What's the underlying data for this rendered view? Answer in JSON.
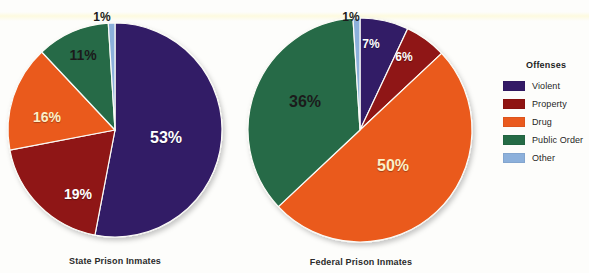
{
  "figure": {
    "background": "#fdfdfb",
    "width": 589,
    "height": 273
  },
  "legend": {
    "title": "Offenses",
    "position": "right",
    "items": [
      {
        "label": "Violent",
        "color": "#331a66"
      },
      {
        "label": "Property",
        "color": "#8f1412"
      },
      {
        "label": "Drug",
        "color": "#ea5a1e"
      },
      {
        "label": "Public Order",
        "color": "#256b46"
      },
      {
        "label": "Other",
        "color": "#8cb0db"
      }
    ]
  },
  "chart_data": [
    {
      "type": "pie",
      "title": "State Prison Inmates",
      "categories": [
        "Violent",
        "Property",
        "Drug",
        "Public Order",
        "Other"
      ],
      "values": [
        53,
        19,
        16,
        11,
        1
      ],
      "labels": [
        "53%",
        "19%",
        "16%",
        "11%",
        "1%"
      ],
      "colors": [
        "#331a66",
        "#8f1412",
        "#ea5a1e",
        "#256b46",
        "#8cb0db"
      ],
      "label_colors": [
        "white",
        "white",
        "cream",
        "dark",
        "dark"
      ],
      "label_positions": [
        {
          "x": 166,
          "y": 138
        },
        {
          "x": 78,
          "y": 194
        },
        {
          "x": 47,
          "y": 117
        },
        {
          "x": 83,
          "y": 55
        },
        {
          "x": 102,
          "y": 17
        }
      ],
      "center": {
        "x": 115,
        "y": 130
      },
      "radius": 107,
      "start_angle": 0,
      "direction": "clockwise",
      "caption_position": {
        "x": 115,
        "y": 256
      }
    },
    {
      "type": "pie",
      "title": "Federal Prison Inmates",
      "categories": [
        "Violent",
        "Property",
        "Drug",
        "Public Order",
        "Other"
      ],
      "values": [
        7,
        6,
        50,
        36,
        1
      ],
      "labels": [
        "7%",
        "6%",
        "50%",
        "36%",
        "1%"
      ],
      "colors": [
        "#331a66",
        "#8f1412",
        "#ea5a1e",
        "#256b46",
        "#8cb0db"
      ],
      "label_colors": [
        "white",
        "white",
        "cream",
        "dark",
        "dark"
      ],
      "label_positions": [
        {
          "x": 371,
          "y": 44
        },
        {
          "x": 404,
          "y": 57
        },
        {
          "x": 393,
          "y": 166
        },
        {
          "x": 305,
          "y": 102
        },
        {
          "x": 351,
          "y": 17
        }
      ],
      "center": {
        "x": 360,
        "y": 130
      },
      "radius": 112,
      "start_angle": 0,
      "direction": "clockwise",
      "caption_position": {
        "x": 361,
        "y": 257
      }
    }
  ]
}
